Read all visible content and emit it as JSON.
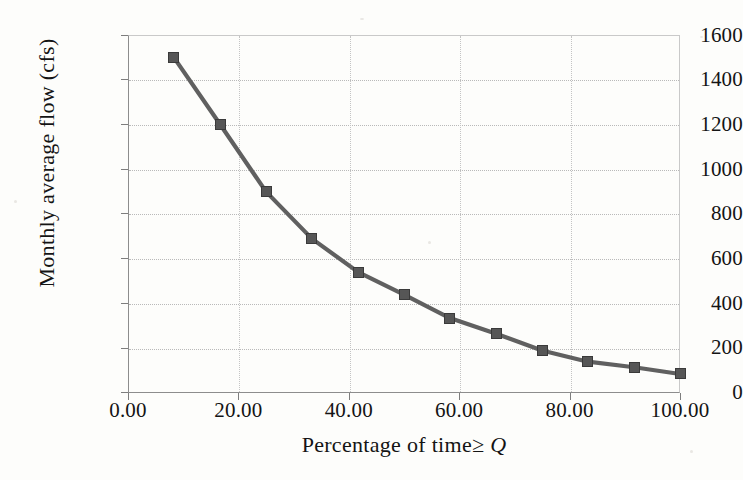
{
  "figure": {
    "background_color": "#fdfdfb",
    "series_color": "#606060",
    "marker_color": "#565656",
    "grid_color": "#b9b9b9",
    "axis_color": "#8d8d8d"
  },
  "axes": {
    "y_title": "Monthly average flow (cfs)",
    "x_title_prefix": "Percentage of time",
    "x_title_symbol": "≥ Q",
    "y_ticks": [
      "1600",
      "1400",
      "1200",
      "1000",
      "800",
      "600",
      "400",
      "200",
      "0"
    ],
    "x_ticks": [
      "0.00",
      "20.00",
      "40.00",
      "60.00",
      "80.00",
      "100.00"
    ]
  },
  "chart_data": {
    "type": "line",
    "title": "",
    "subtitle": "",
    "xlabel": "Percentage of time ≥ Q",
    "ylabel": "Monthly average flow (cfs)",
    "xlim": [
      0,
      100
    ],
    "ylim": [
      0,
      1600
    ],
    "xticks": [
      0,
      20,
      40,
      60,
      80,
      100
    ],
    "yticks": [
      0,
      200,
      400,
      600,
      800,
      1000,
      1200,
      1400,
      1600
    ],
    "xtick_labels": [
      "0.00",
      "20.00",
      "40.00",
      "60.00",
      "80.00",
      "100.00"
    ],
    "ytick_labels": [
      "0",
      "200",
      "400",
      "600",
      "800",
      "1000",
      "1200",
      "1400",
      "1600"
    ],
    "grid": true,
    "legend": null,
    "legend_position": "none",
    "marker": "square",
    "annotations": [],
    "series": [
      {
        "name": "Flow duration curve",
        "x": [
          8.3,
          16.7,
          25.0,
          33.3,
          41.7,
          50.0,
          58.3,
          66.7,
          75.0,
          83.3,
          91.7,
          100.0
        ],
        "y": [
          1500,
          1200,
          900,
          690,
          540,
          440,
          335,
          265,
          190,
          140,
          115,
          85
        ]
      }
    ]
  }
}
